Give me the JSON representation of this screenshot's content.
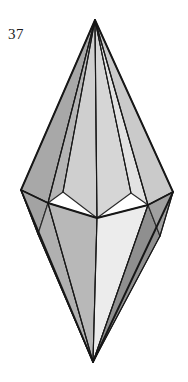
{
  "plate": {
    "width": 188,
    "height": 382,
    "background_color": "#ffffff",
    "figure_number": "37",
    "caption_position": "top-left"
  },
  "solid": {
    "name": "hexagonal-bipyramid",
    "outline_color": "#171717",
    "edge_color": "#2b2b2b",
    "vertices": {
      "apex_top": [
        95,
        20
      ],
      "apex_bottom": [
        93,
        362
      ],
      "equator_left": [
        21,
        190
      ],
      "equator_left_front": [
        48,
        203
      ],
      "equator_front": [
        97,
        218
      ],
      "equator_right_front": [
        148,
        205
      ],
      "equator_right": [
        173,
        192
      ]
    },
    "facets": [
      {
        "id": "upper-left-outer",
        "shade": "#a8a8a8"
      },
      {
        "id": "upper-left-inner",
        "shade": "#b4b4b4"
      },
      {
        "id": "upper-center-left",
        "shade": "#cfcfcf"
      },
      {
        "id": "upper-center-right",
        "shade": "#d6d6d6"
      },
      {
        "id": "upper-right-inner",
        "shade": "#e2e2e2"
      },
      {
        "id": "upper-right-outer",
        "shade": "#cacaca"
      },
      {
        "id": "lower-left-outer",
        "shade": "#9a9a9a"
      },
      {
        "id": "lower-left-inner",
        "shade": "#b0b0b0"
      },
      {
        "id": "lower-center-left",
        "shade": "#b8b8b8"
      },
      {
        "id": "lower-center-right",
        "shade": "#ececec"
      },
      {
        "id": "lower-right-inner",
        "shade": "#8f8f8f"
      },
      {
        "id": "lower-right-outer",
        "shade": "#a0a0a0"
      }
    ]
  }
}
